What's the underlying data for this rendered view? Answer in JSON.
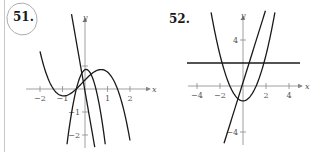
{
  "problems": [
    {
      "number": "51.",
      "circled": true,
      "graph": {
        "x_label": "x",
        "y_label": "y",
        "x_ticks": [
          {
            "value": -2,
            "label": "−2"
          },
          {
            "value": -1,
            "label": "−1"
          },
          {
            "value": 1,
            "label": "1"
          },
          {
            "value": 2,
            "label": "2"
          }
        ],
        "y_ticks": [
          {
            "value": 1,
            "label": ""
          },
          {
            "value": -1,
            "label": "−1"
          },
          {
            "value": -2,
            "label": "−2"
          }
        ],
        "curves": [
          "cubic",
          "parabola",
          "steep-line"
        ]
      }
    },
    {
      "number": "52.",
      "circled": false,
      "graph": {
        "x_label": "x",
        "y_label": "y",
        "x_ticks": [
          {
            "value": -4,
            "label": "−4"
          },
          {
            "value": -2,
            "label": "−2"
          },
          {
            "value": 2,
            "label": "2"
          },
          {
            "value": 4,
            "label": "4"
          }
        ],
        "y_ticks": [
          {
            "value": 4,
            "label": "4"
          },
          {
            "value": -4,
            "label": "−4"
          }
        ],
        "curves": [
          "parabola",
          "line",
          "horizontal-line"
        ]
      }
    }
  ],
  "colors": {
    "curve": "#1a1a1a",
    "axis": "#888888",
    "circle": "#9a9a9a"
  }
}
